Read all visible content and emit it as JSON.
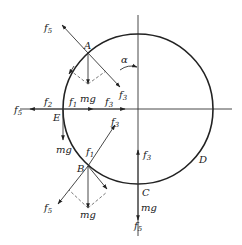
{
  "diagram": {
    "type": "free-body force diagram on vertical circular track",
    "points": {
      "A": "A",
      "B": "B",
      "C": "C",
      "D": "D",
      "E": "E"
    },
    "angle_label": "α",
    "labels": {
      "f": "f",
      "mg": "mg",
      "sub1": "1",
      "sub2": "2",
      "sub3": "3",
      "sub5": "5"
    },
    "forces_at_A": [
      "f5",
      "mg",
      "f3",
      "f1"
    ],
    "forces_at_E": [
      "f5",
      "f2",
      "f1",
      "f3",
      "mg"
    ],
    "forces_at_B": [
      "f1",
      "f3",
      "f5",
      "mg"
    ],
    "forces_at_C": [
      "f3",
      "mg",
      "f5"
    ],
    "colors": {
      "stroke": "#222222",
      "background": "#ffffff"
    }
  }
}
